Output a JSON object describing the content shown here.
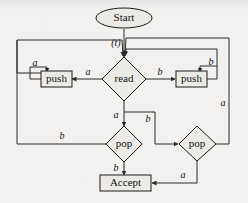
{
  "diagram": {
    "nodes": {
      "start": {
        "label": "Start",
        "shape": "ellipse"
      },
      "read": {
        "label": "read",
        "shape": "diamond"
      },
      "push_left": {
        "label": "push",
        "shape": "rect"
      },
      "push_right": {
        "label": "push",
        "shape": "rect"
      },
      "pop_left": {
        "label": "pop",
        "shape": "diamond"
      },
      "pop_right": {
        "label": "pop",
        "shape": "diamond"
      },
      "accept": {
        "label": "Accept",
        "shape": "rect"
      }
    },
    "edge_labels": {
      "start_to_read": "(t)",
      "read_to_push_left": "a",
      "read_to_push_right": "b",
      "push_left_loop": "a",
      "push_right_loop": "b",
      "read_to_pop_left": "a",
      "read_to_pop_right": "b",
      "pop_left_to_read": "b",
      "pop_left_to_accept": "b",
      "pop_right_to_read": "a",
      "pop_right_to_accept": "a"
    },
    "colors": {
      "paper": "#f2f1ef",
      "ink": "#1a1a1a",
      "shape_fill": "#eceae7",
      "edge": "#2a2a2a"
    }
  }
}
